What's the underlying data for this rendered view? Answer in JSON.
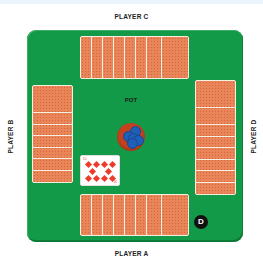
{
  "players": {
    "top": {
      "label": "PLAYER C",
      "cards_face_down": 8
    },
    "bottom": {
      "label": "PLAYER A",
      "cards_face_down": 8,
      "is_dealer": true
    },
    "left": {
      "label": "PLAYER B",
      "cards_face_down": 7
    },
    "right": {
      "label": "PLAYER D",
      "cards_face_down": 8
    }
  },
  "center": {
    "pot_label": "POT",
    "pot_chip_color": "#1f5fb8",
    "face_up_card": {
      "rank": "10",
      "suit": "diamonds",
      "pips_rows": [
        4,
        2,
        4
      ]
    }
  },
  "dealer_button": {
    "label": "D"
  },
  "colors": {
    "table_felt": "#139a48",
    "card_back": "#e8865a",
    "pot_rim": "#c2421e"
  }
}
